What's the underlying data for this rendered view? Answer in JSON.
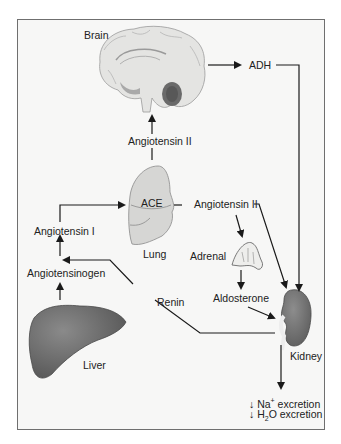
{
  "organs": {
    "brain": "Brain",
    "lung": "Lung",
    "adrenal": "Adrenal",
    "liver": "Liver",
    "kidney": "Kidney"
  },
  "substances": {
    "ace": "ACE",
    "angiotensin_ii_brain": "Angiotensin II",
    "angiotensin_ii_lung": "Angiotensin II",
    "angiotensin_i": "Angiotensin I",
    "angiotensinogen": "Angiotensinogen",
    "renin": "Renin",
    "aldosterone": "Aldosterone",
    "adh": "ADH"
  },
  "outcomes": {
    "na_arrow": "↓",
    "na_prefix": "Na",
    "na_sup": "+",
    "na_text": " excretion",
    "h2o_arrow": "↓",
    "h2o_prefix": "H",
    "h2o_sub": "2",
    "h2o_text": "O excretion"
  },
  "colors": {
    "background": "#f7f7f6",
    "frame": "#6f6f6f",
    "organ_light": "#dcdcdc",
    "organ_dark": "#6e6e6e",
    "line": "#1a1a1a"
  }
}
